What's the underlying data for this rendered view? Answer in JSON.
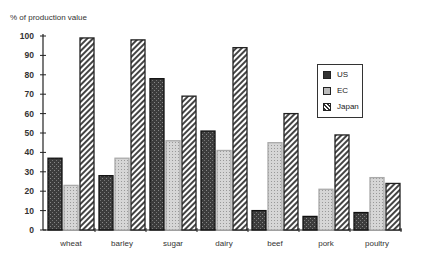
{
  "chart_data": {
    "type": "bar",
    "title": "",
    "ylabel": "% of production value",
    "xlabel": "",
    "ylim": [
      0,
      100
    ],
    "yticks": [
      0,
      10,
      20,
      30,
      40,
      50,
      60,
      70,
      80,
      90,
      100
    ],
    "categories": [
      "wheat",
      "barley",
      "sugar",
      "dairy",
      "beef",
      "pork",
      "poultry"
    ],
    "series": [
      {
        "name": "US",
        "values": [
          37,
          28,
          78,
          51,
          10,
          7,
          9
        ]
      },
      {
        "name": "EC",
        "values": [
          23,
          37,
          46,
          41,
          45,
          21,
          27
        ]
      },
      {
        "name": "Japan",
        "values": [
          99,
          98,
          69,
          94,
          60,
          49,
          24
        ]
      }
    ],
    "legend_position": "upper right",
    "grid": false
  },
  "legend": {
    "items": [
      {
        "label": "US",
        "pattern": "dark-stipple"
      },
      {
        "label": "EC",
        "pattern": "light-dots"
      },
      {
        "label": "Japan",
        "pattern": "diagonal-hatch"
      }
    ]
  },
  "colors": {
    "us": "#3a3a3a",
    "ec": "#c8c8c8",
    "japan": "#555555",
    "axis": "#222222"
  }
}
